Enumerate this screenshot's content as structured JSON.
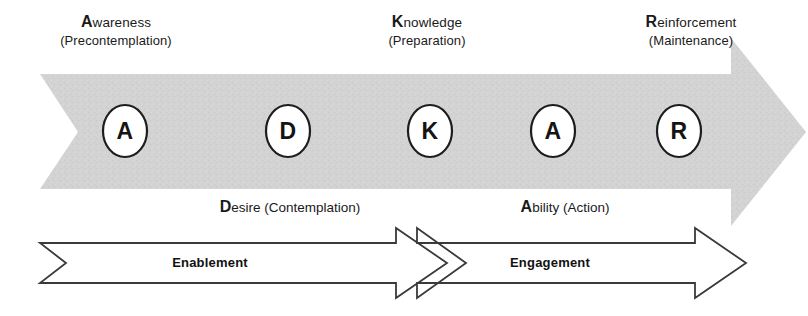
{
  "diagram": {
    "colors": {
      "band_fill": "#d2d2d2",
      "band_texture": "#c9c9c9",
      "circle_fill": "#ffffff",
      "circle_stroke": "#1d1d1d",
      "arrow_stroke": "#3a3a3a",
      "arrow_fill": "#ffffff",
      "text": "#1a1a1a"
    }
  },
  "stage_labels": [
    {
      "cap": "A",
      "rest": "wareness",
      "sub": "(Precontemplation)"
    },
    {
      "cap": "K",
      "rest": "nowledge",
      "sub": "(Preparation)"
    },
    {
      "cap": "R",
      "rest": "einforcement",
      "sub": "(Maintenance)"
    }
  ],
  "nodes": [
    {
      "letter": "A",
      "name": "awareness"
    },
    {
      "letter": "D",
      "name": "desire"
    },
    {
      "letter": "K",
      "name": "knowledge"
    },
    {
      "letter": "A",
      "name": "ability"
    },
    {
      "letter": "R",
      "name": "reinforcement"
    }
  ],
  "phase_labels": [
    {
      "cap": "D",
      "rest": "esire (Contemplation)"
    },
    {
      "cap": "A",
      "rest": "bility (Action)"
    }
  ],
  "bars": [
    {
      "label": "Enablement"
    },
    {
      "label": "Engagement"
    }
  ]
}
